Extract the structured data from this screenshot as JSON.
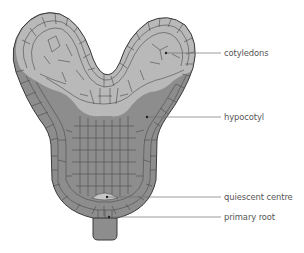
{
  "diagram": {
    "colors": {
      "cotyledon_fill": "#b9b9b9",
      "hypocotyl_fill": "#8d8d8d",
      "qc_fill": "#c6c6c6",
      "outline": "#3a3a3a",
      "cell_wall": "#4a4a4a",
      "leader_line": "#707070",
      "label_text": "#555555"
    },
    "labels": [
      {
        "id": "cotyledons",
        "text": "cotyledons",
        "x": 225,
        "y": 48,
        "point": [
          166,
          53
        ]
      },
      {
        "id": "hypocotyl",
        "text": "hypocotyl",
        "x": 225,
        "y": 112,
        "point": [
          147,
          117
        ]
      },
      {
        "id": "quiescent-centre",
        "text": "quiescent centre",
        "x": 225,
        "y": 192,
        "point": [
          107,
          197
        ]
      },
      {
        "id": "primary-root",
        "text": "primary root",
        "x": 225,
        "y": 212,
        "point": [
          109,
          217
        ]
      }
    ]
  }
}
